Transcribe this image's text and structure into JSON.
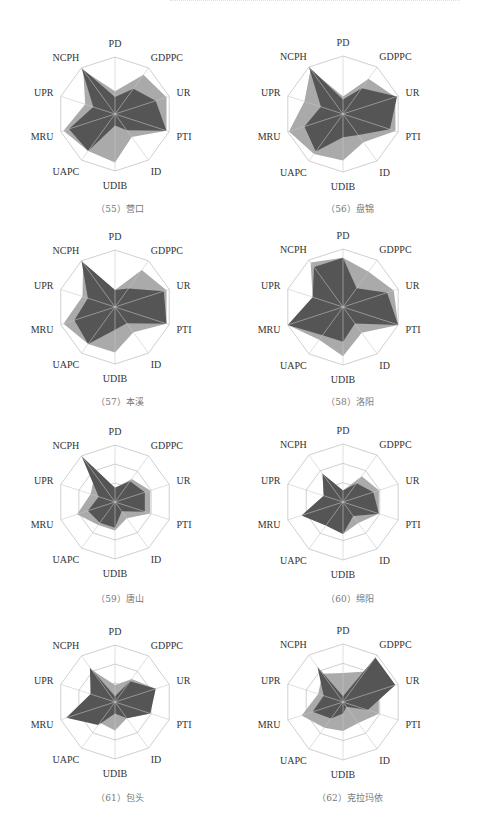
{
  "header": {
    "text": ""
  },
  "axes": [
    "PD",
    "GDPPC",
    "UR",
    "PTI",
    "ID",
    "UDIB",
    "UAPC",
    "MRU",
    "UPR",
    "NCPH"
  ],
  "colors": {
    "city_fill": "#555555",
    "reference_fill": "#aaaaaa",
    "grid": "#d0d0d0",
    "spoke": "#c8c8c8"
  },
  "chart_data": [
    {
      "type": "radar",
      "title": "（55）营口",
      "categories": [
        "PD",
        "GDPPC",
        "UR",
        "PTI",
        "ID",
        "UDIB",
        "UAPC",
        "MRU",
        "UPR",
        "NCPH"
      ],
      "series": [
        {
          "name": "reference",
          "values": [
            0.4,
            0.85,
            0.95,
            0.95,
            0.5,
            0.85,
            0.8,
            0.95,
            0.55,
            0.95
          ]
        },
        {
          "name": "city",
          "values": [
            0.3,
            0.55,
            0.75,
            0.95,
            0.35,
            0.2,
            0.8,
            0.85,
            0.4,
            1.0
          ]
        }
      ],
      "rings": 1,
      "ylim": [
        0,
        1
      ]
    },
    {
      "type": "radar",
      "title": "（56）盘锦",
      "categories": [
        "PD",
        "GDPPC",
        "UR",
        "PTI",
        "ID",
        "UDIB",
        "UAPC",
        "MRU",
        "UPR",
        "NCPH"
      ],
      "series": [
        {
          "name": "reference",
          "values": [
            0.3,
            0.75,
            0.95,
            0.95,
            0.6,
            0.8,
            0.85,
            0.98,
            0.7,
            0.95
          ]
        },
        {
          "name": "city",
          "values": [
            0.25,
            0.55,
            0.98,
            0.85,
            0.45,
            0.4,
            0.8,
            0.7,
            0.4,
            1.0
          ]
        }
      ],
      "rings": 1,
      "ylim": [
        0,
        1
      ]
    },
    {
      "type": "radar",
      "title": "（57）本溪",
      "categories": [
        "PD",
        "GDPPC",
        "UR",
        "PTI",
        "ID",
        "UDIB",
        "UAPC",
        "MRU",
        "UPR",
        "NCPH"
      ],
      "series": [
        {
          "name": "reference",
          "values": [
            0.3,
            0.8,
            0.95,
            0.95,
            0.55,
            0.8,
            0.8,
            0.95,
            0.6,
            0.95
          ]
        },
        {
          "name": "city",
          "values": [
            0.3,
            0.4,
            0.9,
            0.95,
            0.35,
            0.4,
            0.8,
            0.75,
            0.5,
            1.0
          ]
        }
      ],
      "rings": 1,
      "ylim": [
        0,
        1
      ]
    },
    {
      "type": "radar",
      "title": "（58）洛阳",
      "categories": [
        "PD",
        "GDPPC",
        "UR",
        "PTI",
        "ID",
        "UDIB",
        "UAPC",
        "MRU",
        "UPR",
        "NCPH"
      ],
      "series": [
        {
          "name": "reference",
          "values": [
            0.85,
            0.75,
            0.92,
            1.0,
            0.55,
            0.85,
            0.7,
            1.0,
            0.55,
            0.95
          ]
        },
        {
          "name": "city",
          "values": [
            0.85,
            0.4,
            0.8,
            1.0,
            0.35,
            0.6,
            0.6,
            1.0,
            0.55,
            0.85
          ]
        }
      ],
      "rings": 1,
      "ylim": [
        0,
        1
      ]
    },
    {
      "type": "radar",
      "title": "（59）唐山",
      "categories": [
        "PD",
        "GDPPC",
        "UR",
        "PTI",
        "ID",
        "UDIB",
        "UAPC",
        "MRU",
        "UPR",
        "NCPH"
      ],
      "series": [
        {
          "name": "reference",
          "values": [
            0.25,
            0.5,
            0.65,
            0.65,
            0.35,
            0.5,
            0.5,
            0.7,
            0.45,
            0.6
          ]
        },
        {
          "name": "city",
          "values": [
            0.25,
            0.45,
            0.55,
            0.55,
            0.2,
            0.45,
            0.45,
            0.5,
            0.3,
            1.0
          ]
        }
      ],
      "rings": 3,
      "ylim": [
        0,
        1
      ]
    },
    {
      "type": "radar",
      "title": "（60）绵阳",
      "categories": [
        "PD",
        "GDPPC",
        "UR",
        "PTI",
        "ID",
        "UDIB",
        "UAPC",
        "MRU",
        "UPR",
        "NCPH"
      ],
      "series": [
        {
          "name": "reference",
          "values": [
            0.2,
            0.55,
            0.65,
            0.65,
            0.45,
            0.55,
            0.5,
            0.75,
            0.35,
            0.6
          ]
        },
        {
          "name": "city",
          "values": [
            0.2,
            0.4,
            0.55,
            0.65,
            0.3,
            0.55,
            0.5,
            0.75,
            0.35,
            0.6
          ]
        }
      ],
      "rings": 3,
      "ylim": [
        0,
        1
      ]
    },
    {
      "type": "radar",
      "title": "（61）包头",
      "categories": [
        "PD",
        "GDPPC",
        "UR",
        "PTI",
        "ID",
        "UDIB",
        "UAPC",
        "MRU",
        "UPR",
        "NCPH"
      ],
      "series": [
        {
          "name": "reference",
          "values": [
            0.3,
            0.5,
            0.75,
            0.65,
            0.35,
            0.5,
            0.45,
            0.75,
            0.45,
            0.7
          ]
        },
        {
          "name": "city",
          "values": [
            0.1,
            0.45,
            0.75,
            0.65,
            0.35,
            0.2,
            0.5,
            0.9,
            0.45,
            0.75
          ]
        }
      ],
      "rings": 3,
      "ylim": [
        0,
        1
      ]
    },
    {
      "type": "radar",
      "title": "（62）克拉玛依",
      "categories": [
        "PD",
        "GDPPC",
        "UR",
        "PTI",
        "ID",
        "UDIB",
        "UAPC",
        "MRU",
        "UPR",
        "NCPH"
      ],
      "series": [
        {
          "name": "reference",
          "values": [
            0.5,
            0.65,
            0.65,
            0.65,
            0.45,
            0.5,
            0.55,
            0.75,
            0.45,
            0.6
          ]
        },
        {
          "name": "city",
          "values": [
            0.1,
            0.95,
            0.95,
            0.45,
            0.1,
            0.2,
            0.35,
            0.55,
            0.35,
            0.75
          ]
        }
      ],
      "rings": 3,
      "ylim": [
        0,
        1
      ]
    }
  ],
  "layout": [
    {
      "left": 0,
      "top": 10,
      "cx": 115,
      "cy": 104,
      "r": 57,
      "caption_top": 192
    },
    {
      "left": 230,
      "top": 10,
      "cx": 113,
      "cy": 104,
      "r": 58,
      "caption_top": 192
    },
    {
      "left": 0,
      "top": 215,
      "cx": 115,
      "cy": 92,
      "r": 57,
      "caption_top": 180
    },
    {
      "left": 230,
      "top": 215,
      "cx": 113,
      "cy": 92,
      "r": 58,
      "caption_top": 180
    },
    {
      "left": 0,
      "top": 410,
      "cx": 115,
      "cy": 92,
      "r": 57,
      "caption_top": 182
    },
    {
      "left": 230,
      "top": 410,
      "cx": 113,
      "cy": 92,
      "r": 58,
      "caption_top": 182
    },
    {
      "left": 0,
      "top": 605,
      "cx": 115,
      "cy": 97,
      "r": 57,
      "caption_top": 186
    },
    {
      "left": 230,
      "top": 605,
      "cx": 113,
      "cy": 97,
      "r": 58,
      "caption_top": 186
    }
  ]
}
